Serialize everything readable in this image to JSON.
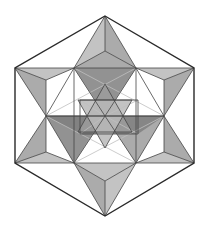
{
  "diagram": {
    "title": "",
    "colors": {
      "background": "#ffffff",
      "outline": "#2a2a2a",
      "edge": "#444444",
      "light_fill": "#b8b8b8",
      "mid_fill": "#9c9c9c",
      "dark_fill": "#7f7f7f",
      "inner_line": "#bfbfbf"
    },
    "points": {
      "T": [
        105,
        16
      ],
      "UL": [
        15,
        68
      ],
      "UR": [
        194,
        68
      ],
      "LL": [
        15,
        163
      ],
      "LR": [
        194,
        163
      ],
      "B": [
        105,
        216
      ],
      "a": [
        74,
        68
      ],
      "b": [
        136,
        68
      ],
      "c": [
        46,
        116
      ],
      "d": [
        164,
        116
      ],
      "e": [
        74,
        163
      ],
      "f": [
        136,
        163
      ],
      "O": [
        105,
        116
      ],
      "tm": [
        105,
        51
      ],
      "bm": [
        105,
        181
      ],
      "ul2": [
        46,
        80
      ],
      "ur2": [
        164,
        80
      ],
      "ll2": [
        46,
        152
      ],
      "lr2": [
        164,
        152
      ],
      "i1": [
        105,
        84
      ],
      "i2": [
        105,
        148
      ],
      "i3": [
        78,
        100
      ],
      "i4": [
        132,
        100
      ],
      "i5": [
        78,
        132
      ],
      "i6": [
        132,
        132
      ],
      "s1": [
        80,
        100
      ],
      "s2": [
        138,
        100
      ],
      "s3": [
        80,
        134
      ],
      "s4": [
        138,
        134
      ]
    },
    "faces": [
      {
        "pts": [
          "T",
          "a",
          "tm"
        ],
        "shade": "light_fill"
      },
      {
        "pts": [
          "T",
          "tm",
          "b"
        ],
        "shade": "mid_fill"
      },
      {
        "pts": [
          "a",
          "tm",
          "b"
        ],
        "shade": "mid_fill"
      },
      {
        "pts": [
          "a",
          "b",
          "O"
        ],
        "shade": "dark_fill"
      },
      {
        "pts": [
          "UL",
          "a",
          "ul2"
        ],
        "shade": "light_fill"
      },
      {
        "pts": [
          "UL",
          "ul2",
          "c"
        ],
        "shade": "mid_fill"
      },
      {
        "pts": [
          "UR",
          "b",
          "ur2"
        ],
        "shade": "light_fill"
      },
      {
        "pts": [
          "UR",
          "ur2",
          "d"
        ],
        "shade": "mid_fill"
      },
      {
        "pts": [
          "LL",
          "ll2",
          "e"
        ],
        "shade": "light_fill"
      },
      {
        "pts": [
          "LL",
          "c",
          "ll2"
        ],
        "shade": "mid_fill"
      },
      {
        "pts": [
          "LR",
          "lr2",
          "f"
        ],
        "shade": "light_fill"
      },
      {
        "pts": [
          "LR",
          "d",
          "lr2"
        ],
        "shade": "mid_fill"
      },
      {
        "pts": [
          "B",
          "e",
          "bm"
        ],
        "shade": "mid_fill"
      },
      {
        "pts": [
          "B",
          "bm",
          "f"
        ],
        "shade": "light_fill"
      },
      {
        "pts": [
          "e",
          "bm",
          "f"
        ],
        "shade": "light_fill"
      },
      {
        "pts": [
          "c",
          "O",
          "e"
        ],
        "shade": "dark_fill"
      },
      {
        "pts": [
          "d",
          "O",
          "f"
        ],
        "shade": "mid_fill"
      },
      {
        "pts": [
          "c",
          "d",
          "s4",
          "s3"
        ],
        "shade": "dark_fill"
      },
      {
        "pts": [
          "i1",
          "i5",
          "i6"
        ],
        "shade": "mid_fill"
      },
      {
        "pts": [
          "i2",
          "i3",
          "i4"
        ],
        "shade": "light_fill"
      }
    ],
    "outline": [
      "T",
      "UR",
      "LR",
      "B",
      "LL",
      "UL"
    ],
    "edges": [
      [
        "a",
        "b"
      ],
      [
        "a",
        "c"
      ],
      [
        "c",
        "e"
      ],
      [
        "e",
        "f"
      ],
      [
        "f",
        "d"
      ],
      [
        "d",
        "b"
      ],
      [
        "a",
        "e"
      ],
      [
        "b",
        "f"
      ],
      [
        "c",
        "d"
      ],
      [
        "T",
        "a"
      ],
      [
        "T",
        "b"
      ],
      [
        "UL",
        "a"
      ],
      [
        "UL",
        "c"
      ],
      [
        "UR",
        "b"
      ],
      [
        "UR",
        "d"
      ],
      [
        "LL",
        "c"
      ],
      [
        "LL",
        "e"
      ],
      [
        "LR",
        "d"
      ],
      [
        "LR",
        "f"
      ],
      [
        "B",
        "e"
      ],
      [
        "B",
        "f"
      ],
      [
        "a",
        "tm"
      ],
      [
        "b",
        "tm"
      ],
      [
        "T",
        "tm"
      ],
      [
        "e",
        "bm"
      ],
      [
        "f",
        "bm"
      ],
      [
        "B",
        "bm"
      ],
      [
        "UL",
        "ul2"
      ],
      [
        "a",
        "ul2"
      ],
      [
        "c",
        "ul2"
      ],
      [
        "UR",
        "ur2"
      ],
      [
        "b",
        "ur2"
      ],
      [
        "d",
        "ur2"
      ],
      [
        "LL",
        "ll2"
      ],
      [
        "c",
        "ll2"
      ],
      [
        "e",
        "ll2"
      ],
      [
        "LR",
        "lr2"
      ],
      [
        "d",
        "lr2"
      ],
      [
        "f",
        "lr2"
      ],
      [
        "i1",
        "i5"
      ],
      [
        "i5",
        "i6"
      ],
      [
        "i6",
        "i1"
      ],
      [
        "i2",
        "i3"
      ],
      [
        "i3",
        "i4"
      ],
      [
        "i4",
        "i2"
      ],
      [
        "a",
        "O"
      ],
      [
        "b",
        "O"
      ],
      [
        "c",
        "O"
      ],
      [
        "d",
        "O"
      ],
      [
        "e",
        "O"
      ],
      [
        "f",
        "O"
      ],
      [
        "s1",
        "s2"
      ],
      [
        "s2",
        "s4"
      ],
      [
        "s4",
        "s3"
      ],
      [
        "s3",
        "s1"
      ]
    ],
    "inner_lines": [
      [
        "a",
        "d"
      ],
      [
        "b",
        "c"
      ],
      [
        "c",
        "f"
      ],
      [
        "d",
        "e"
      ],
      [
        "a",
        "f"
      ],
      [
        "b",
        "e"
      ],
      [
        "s1",
        "O"
      ],
      [
        "s2",
        "O"
      ],
      [
        "s3",
        "O"
      ],
      [
        "s4",
        "O"
      ]
    ]
  }
}
